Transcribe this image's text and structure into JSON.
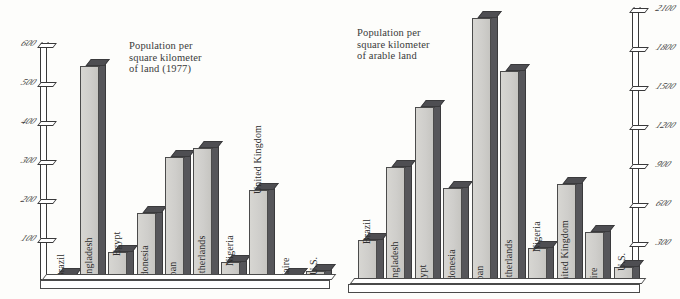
{
  "figure": {
    "caption_left": "Population per\nsquare kilometer\nof land (1977)",
    "caption_right": "Population per\nsquare kilometer\nof arable land"
  },
  "chart_data": [
    {
      "type": "bar",
      "title": "Population per square kilometer of land (1977)",
      "xlabel": "",
      "ylabel": "",
      "ylim": [
        0,
        600
      ],
      "yticks": [
        100,
        200,
        300,
        400,
        500,
        600
      ],
      "ytick_labels": [
        "100",
        "200",
        "300",
        "400",
        "500",
        "600"
      ],
      "grid": false,
      "legend": "none",
      "axis_position": "left",
      "categories": [
        "Brazil",
        "Bangladesh",
        "Egypt",
        "Indonesia",
        "Japan",
        "Netherlands",
        "Nigeria",
        "United Kingdom",
        "Zaire",
        "U.S."
      ],
      "values": [
        13,
        550,
        73,
        173,
        315,
        338,
        45,
        230,
        12,
        24
      ]
    },
    {
      "type": "bar",
      "title": "Population per square kilometer of arable land",
      "xlabel": "",
      "ylabel": "",
      "ylim": [
        0,
        2100
      ],
      "yticks": [
        300,
        600,
        900,
        1200,
        1500,
        1800,
        2100
      ],
      "ytick_labels": [
        "300",
        "600",
        "900",
        "1200",
        "1500",
        "1800",
        "2100"
      ],
      "grid": false,
      "legend": "none",
      "axis_position": "right",
      "categories": [
        "Brazil",
        "Bangladesh",
        "Egypt",
        "Indonesia",
        "Japan",
        "Netherlands",
        "Nigeria",
        "United Kingdom",
        "Zaire",
        "U.S."
      ],
      "values": [
        340,
        900,
        1360,
        740,
        2050,
        1640,
        275,
        770,
        400,
        130
      ]
    }
  ]
}
